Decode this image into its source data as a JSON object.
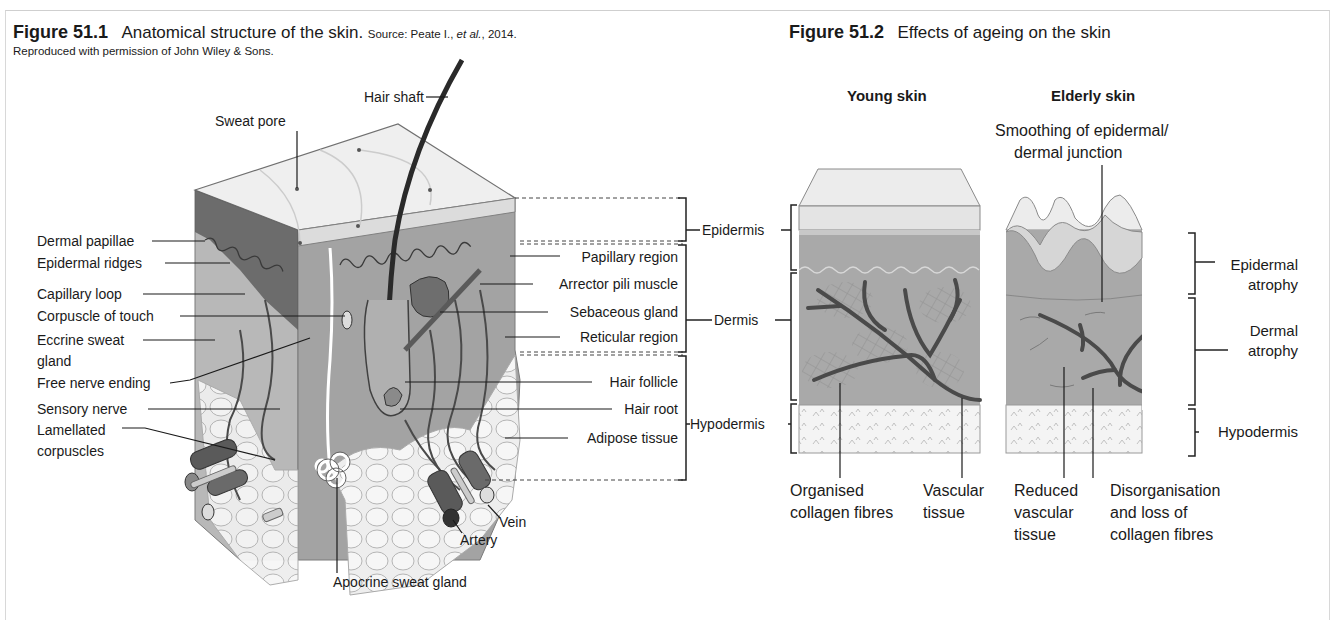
{
  "figure1": {
    "number": "Figure 51.1",
    "title": "Anatomical structure of the skin.",
    "source_prefix": "Source: Peate I., ",
    "source_italic": "et al.",
    "source_suffix": ", 2014.",
    "credit": "Reproduced with permission of John Wiley & Sons.",
    "labels_top": {
      "hair_shaft": "Hair shaft",
      "sweat_pore": "Sweat pore"
    },
    "labels_left": [
      "Dermal papillae",
      "Epidermal ridges",
      "Capillary loop",
      "Corpuscle of touch",
      "Eccrine sweat",
      "gland",
      "Free nerve ending",
      "Sensory nerve",
      "Lamellated",
      "corpuscles"
    ],
    "labels_right": [
      "Papillary region",
      "Arrector pili muscle",
      "Sebaceous gland",
      "Reticular region",
      "Hair follicle",
      "Hair root",
      "Adipose tissue"
    ],
    "labels_bottom": {
      "vein": "Vein",
      "artery": "Artery",
      "apocrine": "Apocrine sweat gland"
    },
    "layers": [
      "Epidermis",
      "Dermis",
      "Hypodermis"
    ]
  },
  "figure2": {
    "number": "Figure 51.2",
    "title": "Effects of ageing on the skin",
    "young_heading": "Young skin",
    "elderly_heading": "Elderly skin",
    "smoothing_line1": "Smoothing of epidermal/",
    "smoothing_line2": "dermal junction",
    "right_labels": {
      "epidermal_atrophy_1": "Epidermal",
      "epidermal_atrophy_2": "atrophy",
      "dermal_atrophy_1": "Dermal",
      "dermal_atrophy_2": "atrophy",
      "hypodermis": "Hypodermis"
    },
    "bottom_labels": {
      "organised_1": "Organised",
      "organised_2": "collagen fibres",
      "vascular_1": "Vascular",
      "vascular_2": "tissue",
      "reduced_1": "Reduced",
      "reduced_2": "vascular",
      "reduced_3": "tissue",
      "disorg_1": "Disorganisation",
      "disorg_2": "and loss of",
      "disorg_3": "collagen fibres"
    }
  },
  "colors": {
    "epidermis_top": "#f0f0f0",
    "dermis": "#a8a8a8",
    "dermis_dark": "#6a6a6a",
    "hypodermis": "#ececec",
    "vessel": "#555555",
    "frame": "#d0d0d0"
  }
}
